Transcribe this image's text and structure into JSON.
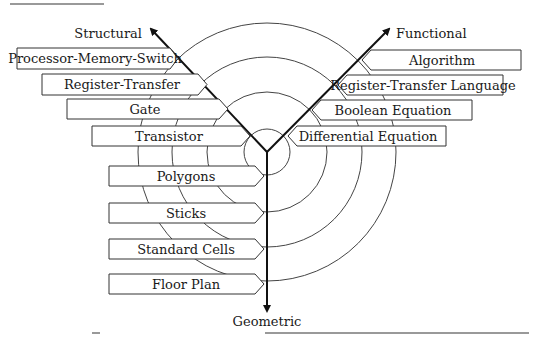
{
  "diagram": {
    "type": "Gajski-Kuhn Y-chart",
    "axes": {
      "structural": "Structural",
      "functional": "Functional",
      "geometric": "Geometric"
    },
    "structural_levels": [
      "Processor-Memory-Switch",
      "Register-Transfer",
      "Gate",
      "Transistor"
    ],
    "functional_levels": [
      "Algorithm",
      "Register-Transfer Language",
      "Boolean Equation",
      "Differential Equation"
    ],
    "geometric_levels": [
      "Polygons",
      "Sticks",
      "Standard Cells",
      "Floor Plan"
    ],
    "colors": {
      "line": "#111111",
      "ring": "#444444",
      "box_border": "#333333",
      "background": "#ffffff"
    }
  }
}
